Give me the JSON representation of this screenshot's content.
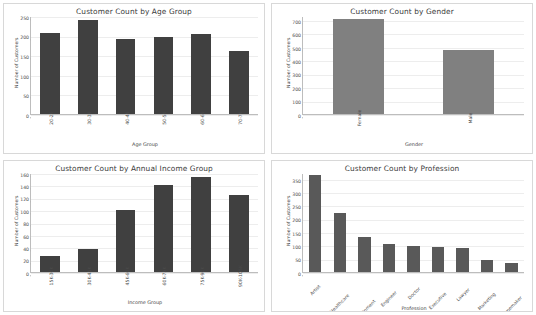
{
  "dashboard": {
    "panels": [
      {
        "name": "age-group-chart",
        "title": "Customer Count by Age Group"
      },
      {
        "name": "gender-chart",
        "title": "Customer Count by Gender"
      },
      {
        "name": "income-group-chart",
        "title": "Customer Count by Annual Income Group"
      },
      {
        "name": "profession-chart",
        "title": "Customer Count by Profession"
      }
    ]
  },
  "chart_data": [
    {
      "type": "bar",
      "title": "Customer Count by Age Group",
      "xlabel": "Age Group",
      "ylabel": "Number of Customers",
      "categories": [
        "20-29",
        "30-39",
        "40-49",
        "50-59",
        "60-69",
        "70-79"
      ],
      "values": [
        207,
        240,
        192,
        196,
        204,
        162
      ],
      "yticks": [
        0,
        50,
        100,
        150,
        200,
        250
      ],
      "ylim": [
        0,
        250
      ],
      "grid": true,
      "legend": "none",
      "bar_color": "#404040"
    },
    {
      "type": "bar",
      "title": "Customer Count by Gender",
      "xlabel": "Gender",
      "ylabel": "Number of Customers",
      "categories": [
        "Female",
        "Male"
      ],
      "values": [
        710,
        476
      ],
      "yticks": [
        0,
        100,
        200,
        300,
        400,
        500,
        600,
        700
      ],
      "ylim": [
        0,
        730
      ],
      "grid": true,
      "legend": "none",
      "bar_color": "#808080"
    },
    {
      "type": "bar",
      "title": "Customer Count by Annual Income Group",
      "xlabel": "Income Group",
      "ylabel": "Number of Customers",
      "categories": [
        "15K-30K",
        "30K-45K",
        "45K-60K",
        "60K-75K",
        "75K-90K",
        "90K-105K"
      ],
      "values": [
        26,
        37,
        100,
        140,
        153,
        124
      ],
      "yticks": [
        0,
        20,
        40,
        60,
        80,
        100,
        120,
        140,
        160
      ],
      "ylim": [
        0,
        160
      ],
      "grid": true,
      "legend": "none",
      "bar_color": "#404040"
    },
    {
      "type": "bar",
      "title": "Customer Count by Profession",
      "xlabel": "Profession",
      "ylabel": "Number of Customers",
      "categories": [
        "Artist",
        "Healthcare",
        "Entertainment",
        "Engineer",
        "Doctor",
        "Executive",
        "Lawyer",
        "Marketing",
        "Homemaker"
      ],
      "values": [
        363,
        222,
        133,
        104,
        98,
        94,
        90,
        47,
        35
      ],
      "yticks": [
        0,
        50,
        100,
        150,
        200,
        250,
        300,
        350
      ],
      "ylim": [
        0,
        372
      ],
      "grid": true,
      "legend": "none",
      "bar_color": "#595959"
    }
  ]
}
